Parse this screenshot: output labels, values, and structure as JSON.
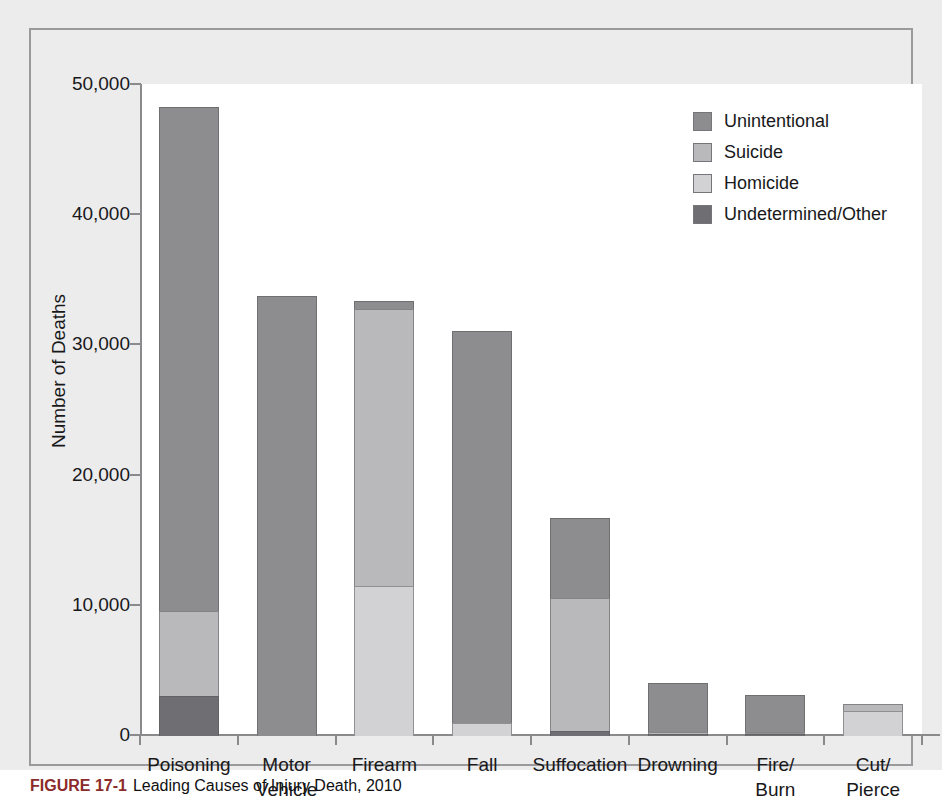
{
  "chart_data": {
    "type": "bar",
    "subtype": "stacked-bar",
    "title": "",
    "xlabel": "",
    "ylabel": "Number of Deaths",
    "ylim": [
      0,
      50000
    ],
    "ytick_labels": [
      "0",
      "10,000",
      "20,000",
      "30,000",
      "40,000",
      "50,000"
    ],
    "ytick_values": [
      0,
      10000,
      20000,
      30000,
      40000,
      50000
    ],
    "grid": false,
    "legend_position": "top-right",
    "categories": [
      "Poisoning",
      "Motor Vehicle",
      "Firearm",
      "Fall",
      "Suffocation",
      "Drowning",
      "Fire/ Burn",
      "Cut/ Pierce"
    ],
    "category_lines": [
      [
        "Poisoning"
      ],
      [
        "Motor",
        "Vehicle"
      ],
      [
        "Firearm"
      ],
      [
        "Fall"
      ],
      [
        "Suffocation"
      ],
      [
        "Drowning"
      ],
      [
        "Fire/",
        "Burn"
      ],
      [
        "Cut/",
        "Pierce"
      ]
    ],
    "series": [
      {
        "name": "Unintentional",
        "color": "#8d8d8f",
        "values": [
          38800,
          33800,
          700,
          30200,
          6200,
          3800,
          2900,
          0
        ]
      },
      {
        "name": "Suicide",
        "color": "#b9b9bb",
        "values": [
          6600,
          0,
          21400,
          0,
          10300,
          250,
          120,
          600
        ]
      },
      {
        "name": "Homicide",
        "color": "#d2d2d4",
        "values": [
          0,
          0,
          11500,
          1000,
          0,
          0,
          100,
          1900
        ]
      },
      {
        "name": "Undetermined/Other",
        "color": "#6f6f73",
        "values": [
          3100,
          0,
          0,
          0,
          400,
          50,
          80,
          0
        ]
      }
    ],
    "stack_order_bottom_to_top": [
      "Undetermined/Other",
      "Homicide",
      "Suicide",
      "Unintentional"
    ],
    "totals": [
      48500,
      33800,
      33600,
      31200,
      16900,
      4100,
      3200,
      2500
    ]
  },
  "legend": {
    "items": [
      {
        "label": "Unintentional",
        "color": "#8d8d8f"
      },
      {
        "label": "Suicide",
        "color": "#b9b9bb"
      },
      {
        "label": "Homicide",
        "color": "#d2d2d4"
      },
      {
        "label": "Undetermined/Other",
        "color": "#6f6f73"
      }
    ]
  },
  "caption": {
    "figure_number": "FIGURE 17-1",
    "text": "Leading Causes of Injury Death, 2010"
  },
  "colors": {
    "page_background": "#ececed",
    "plot_background": "#ffffff",
    "axis": "#8a8a8c",
    "panel_border": "#9a9a9c",
    "text": "#18181a",
    "caption_accent": "#8c2b2b"
  }
}
